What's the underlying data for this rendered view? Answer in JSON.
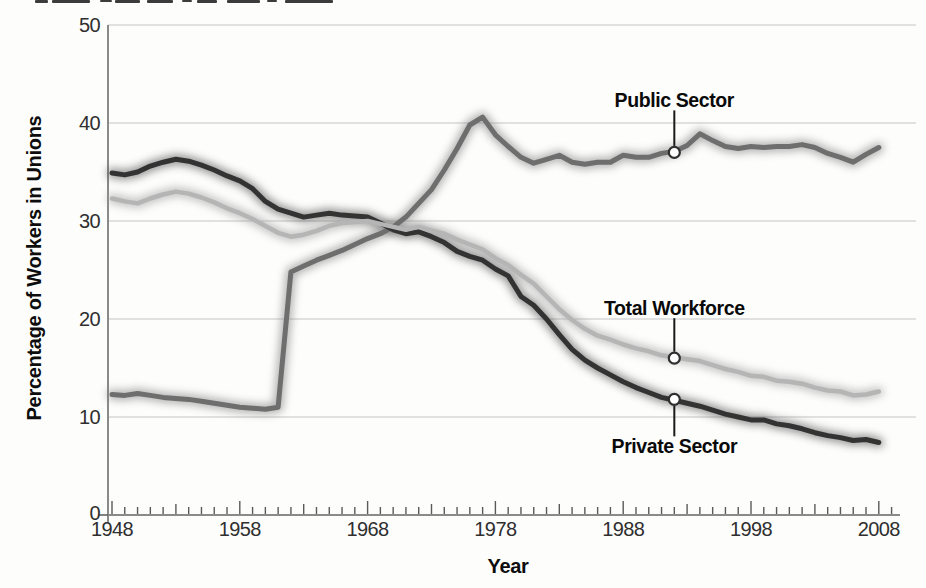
{
  "chart_data": {
    "type": "line",
    "title": "",
    "xlabel": "Year",
    "ylabel": "Percentage of Workers in Unions",
    "xlim": [
      1948,
      2009
    ],
    "ylim": [
      0,
      50
    ],
    "grid": "horizontal gridlines at 10, 20, 30, 40, 50",
    "legend_position": "inline annotations with callout circles",
    "x_tick_labels": [
      "1948",
      "1958",
      "1968",
      "1978",
      "1988",
      "1998",
      "2008"
    ],
    "y_tick_labels": [
      "0",
      "10",
      "20",
      "30",
      "40",
      "50"
    ],
    "x_minor_tick_interval_years": 1,
    "years": {
      "start": 1948,
      "end": 2008,
      "step": 1
    },
    "series": [
      {
        "name": "Public Sector",
        "color": "#6e6e6e",
        "glow_color": "#7c7c7c",
        "values": [
          12.3,
          12.2,
          12.4,
          12.2,
          12.0,
          11.9,
          11.8,
          11.6,
          11.4,
          11.2,
          11.0,
          10.9,
          10.8,
          11.0,
          24.8,
          25.4,
          26.0,
          26.5,
          27.0,
          27.6,
          28.2,
          28.7,
          29.4,
          30.4,
          31.8,
          33.2,
          35.2,
          37.4,
          39.8,
          40.6,
          38.8,
          37.6,
          36.5,
          35.9,
          36.3,
          36.7,
          36.0,
          35.8,
          36.0,
          36.0,
          36.7,
          36.5,
          36.5,
          36.9,
          37.1,
          37.7,
          38.9,
          38.2,
          37.6,
          37.4,
          37.6,
          37.5,
          37.6,
          37.6,
          37.8,
          37.5,
          36.9,
          36.5,
          36.0,
          36.8,
          37.5
        ]
      },
      {
        "name": "Private Sector",
        "color": "#333333",
        "glow_color": "#4a4a4a",
        "values": [
          34.9,
          34.7,
          35.0,
          35.6,
          36.0,
          36.3,
          36.1,
          35.7,
          35.2,
          34.6,
          34.1,
          33.3,
          32.0,
          31.2,
          30.8,
          30.4,
          30.6,
          30.8,
          30.6,
          30.5,
          30.4,
          29.8,
          29.1,
          28.7,
          28.9,
          28.4,
          27.8,
          26.9,
          26.4,
          26.0,
          25.1,
          24.4,
          22.3,
          21.4,
          20.0,
          18.4,
          16.9,
          15.8,
          15.0,
          14.3,
          13.6,
          13.0,
          12.5,
          12.0,
          11.7,
          11.4,
          11.1,
          10.7,
          10.3,
          10.0,
          9.7,
          9.7,
          9.3,
          9.1,
          8.8,
          8.4,
          8.1,
          7.9,
          7.6,
          7.7,
          7.4
        ]
      },
      {
        "name": "Total Workforce",
        "color": "#b5b5b5",
        "glow_color": "#9a9a9a",
        "values": [
          32.3,
          32.0,
          31.8,
          32.3,
          32.7,
          33.0,
          32.8,
          32.4,
          31.9,
          31.3,
          30.8,
          30.2,
          29.5,
          28.8,
          28.4,
          28.6,
          29.0,
          29.5,
          29.8,
          29.9,
          30.0,
          29.7,
          29.4,
          29.1,
          29.4,
          29.0,
          28.7,
          28.1,
          27.6,
          27.1,
          26.2,
          25.5,
          24.5,
          23.6,
          22.3,
          21.0,
          19.9,
          19.0,
          18.3,
          17.9,
          17.4,
          17.0,
          16.7,
          16.3,
          16.1,
          15.9,
          15.7,
          15.3,
          14.9,
          14.6,
          14.2,
          14.1,
          13.7,
          13.6,
          13.4,
          13.0,
          12.7,
          12.6,
          12.2,
          12.3,
          12.6
        ]
      }
    ],
    "annotations": [
      {
        "label": "Public Sector",
        "series": "Public Sector",
        "year": 1992,
        "value": 37.0,
        "label_position": "above"
      },
      {
        "label": "Total Workforce",
        "series": "Total Workforce",
        "year": 1992,
        "value": 16.0,
        "label_position": "above"
      },
      {
        "label": "Private Sector",
        "series": "Private Sector",
        "year": 1992,
        "value": 11.8,
        "label_position": "below"
      }
    ]
  },
  "colors": {
    "background": "#fdfdfc",
    "gridline": "#c6c6c6",
    "axis": "#8a8a8a",
    "tick": "#5a5a5a",
    "tick_label_text": "#2f2f2f",
    "label_text": "#0a0a0a",
    "callout_line": "#1a1a1a",
    "callout_circle_fill": "#ffffff",
    "callout_circle_stroke": "#2e2e2e"
  }
}
